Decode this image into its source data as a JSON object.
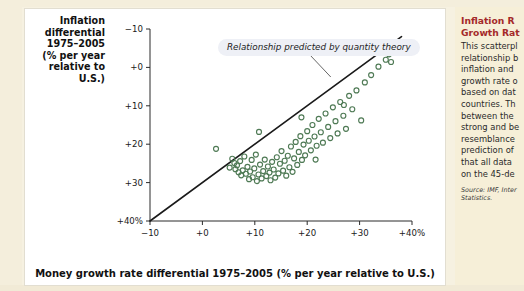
{
  "figure": {
    "panel_bg": "#ffffff",
    "page_bg": "#f6f1e1",
    "sidebar_bg": "#f6efd8",
    "marker_color": "#4f7a55",
    "line_color": "#1a1a1a",
    "title_color": "#a42a2a"
  },
  "axes": {
    "y_title": "Inflation\ndifferential\n1975–2005\n(% per year\nrelative to\nU.S.)",
    "x_title": "Money growth rate differential 1975–2005 (% per year relative to U.S.)",
    "y_ticks": [
      "+40%",
      "+30",
      "+20",
      "+10",
      "+0",
      "−10"
    ],
    "x_ticks": [
      "−10",
      "+0",
      "+10",
      "+20",
      "+30",
      "+40%"
    ]
  },
  "callout": {
    "text": "Relationship predicted by quantity theory"
  },
  "side_note": {
    "title": "Inflation R\nGrowth Rat",
    "body": "This scatterpl\nrelationship b\ninflation and\ngrowth rate o\nbased on dat\ncountries. Th\nbetween the\nstrong and be\nresemblance\nprediction of\nthat all data\non the 45-de",
    "source": "Source: IMF, Inter\nStatistics."
  },
  "chart_data": {
    "type": "scatter",
    "title": "",
    "xlabel": "Money growth rate differential 1975–2005 (% per year relative to U.S.)",
    "ylabel": "Inflation differential 1975–2005 (% per year relative to U.S.)",
    "xlim": [
      -10,
      40
    ],
    "ylim": [
      -10,
      40
    ],
    "xticks": [
      -10,
      0,
      10,
      20,
      30,
      40
    ],
    "yticks": [
      -10,
      0,
      10,
      20,
      30,
      40
    ],
    "grid": false,
    "legend": null,
    "annotations": [
      {
        "text": "Relationship predicted by quantity theory",
        "x": 14,
        "y": 37,
        "points_to": {
          "x": 24.5,
          "y": 27.5
        }
      }
    ],
    "reference_line": {
      "name": "45-degree line",
      "slope": 1,
      "intercept": 0,
      "from": {
        "x": -10,
        "y": -10
      },
      "to": {
        "x": 38,
        "y": 38
      },
      "color": "#1a1a1a"
    },
    "series": [
      {
        "name": "Countries",
        "marker": "open-circle",
        "color": "#4f7a55",
        "points": [
          {
            "x": 2.6,
            "y": 8.8
          },
          {
            "x": 5.2,
            "y": 3.9
          },
          {
            "x": 5.7,
            "y": 6.2
          },
          {
            "x": 6.1,
            "y": 5.1
          },
          {
            "x": 6.3,
            "y": 3.5
          },
          {
            "x": 6.6,
            "y": 4.5
          },
          {
            "x": 6.9,
            "y": 2.7
          },
          {
            "x": 7.2,
            "y": 5.6
          },
          {
            "x": 7.4,
            "y": 1.9
          },
          {
            "x": 7.7,
            "y": 3.2
          },
          {
            "x": 8.0,
            "y": 6.8
          },
          {
            "x": 8.3,
            "y": 2.3
          },
          {
            "x": 8.6,
            "y": 4.1
          },
          {
            "x": 8.9,
            "y": 0.9
          },
          {
            "x": 9.1,
            "y": 2.9
          },
          {
            "x": 9.4,
            "y": 5.9
          },
          {
            "x": 9.6,
            "y": 1.4
          },
          {
            "x": 9.9,
            "y": 3.7
          },
          {
            "x": 10.2,
            "y": 7.3
          },
          {
            "x": 10.4,
            "y": 0.4
          },
          {
            "x": 10.7,
            "y": 2.1
          },
          {
            "x": 11.0,
            "y": 4.7
          },
          {
            "x": 11.3,
            "y": 1.1
          },
          {
            "x": 11.6,
            "y": 3.0
          },
          {
            "x": 11.9,
            "y": 6.0
          },
          {
            "x": 12.2,
            "y": 1.7
          },
          {
            "x": 12.5,
            "y": 4.2
          },
          {
            "x": 12.8,
            "y": 2.6
          },
          {
            "x": 13.0,
            "y": 0.6
          },
          {
            "x": 13.3,
            "y": 5.4
          },
          {
            "x": 13.6,
            "y": 3.4
          },
          {
            "x": 13.9,
            "y": 1.3
          },
          {
            "x": 14.2,
            "y": 6.6
          },
          {
            "x": 14.5,
            "y": 2.4
          },
          {
            "x": 14.8,
            "y": 4.9
          },
          {
            "x": 15.1,
            "y": 8.2
          },
          {
            "x": 15.4,
            "y": 3.1
          },
          {
            "x": 15.7,
            "y": 5.7
          },
          {
            "x": 16.0,
            "y": 1.8
          },
          {
            "x": 16.3,
            "y": 7.0
          },
          {
            "x": 16.6,
            "y": 4.0
          },
          {
            "x": 16.9,
            "y": 9.4
          },
          {
            "x": 17.2,
            "y": 2.8
          },
          {
            "x": 17.5,
            "y": 6.3
          },
          {
            "x": 17.8,
            "y": 10.6
          },
          {
            "x": 18.1,
            "y": 4.6
          },
          {
            "x": 18.4,
            "y": 8.0
          },
          {
            "x": 18.7,
            "y": 12.1
          },
          {
            "x": 19.0,
            "y": 5.9
          },
          {
            "x": 19.3,
            "y": 9.9
          },
          {
            "x": 19.6,
            "y": 7.1
          },
          {
            "x": 20.0,
            "y": 13.4
          },
          {
            "x": 20.3,
            "y": 10.9
          },
          {
            "x": 20.7,
            "y": 8.4
          },
          {
            "x": 21.0,
            "y": 15.0
          },
          {
            "x": 21.4,
            "y": 12.0
          },
          {
            "x": 21.8,
            "y": 9.6
          },
          {
            "x": 22.2,
            "y": 16.6
          },
          {
            "x": 22.6,
            "y": 13.1
          },
          {
            "x": 23.0,
            "y": 10.4
          },
          {
            "x": 23.5,
            "y": 18.0
          },
          {
            "x": 24.0,
            "y": 14.5
          },
          {
            "x": 24.4,
            "y": 11.6
          },
          {
            "x": 24.9,
            "y": 19.6
          },
          {
            "x": 25.4,
            "y": 16.0
          },
          {
            "x": 25.8,
            "y": 12.8
          },
          {
            "x": 26.3,
            "y": 21.0
          },
          {
            "x": 26.9,
            "y": 17.4
          },
          {
            "x": 27.4,
            "y": 14.0
          },
          {
            "x": 28.0,
            "y": 22.6
          },
          {
            "x": 28.6,
            "y": 19.1
          },
          {
            "x": 29.4,
            "y": 24.0
          },
          {
            "x": 30.3,
            "y": 16.2
          },
          {
            "x": 31.0,
            "y": 26.1
          },
          {
            "x": 32.2,
            "y": 28.0
          },
          {
            "x": 33.6,
            "y": 30.2
          },
          {
            "x": 35.0,
            "y": 32.0
          },
          {
            "x": 35.6,
            "y": 33.4
          },
          {
            "x": 36.0,
            "y": 31.4
          },
          {
            "x": 21.6,
            "y": 6.0
          },
          {
            "x": 10.8,
            "y": 13.2
          },
          {
            "x": 18.9,
            "y": 17.0
          },
          {
            "x": 27.0,
            "y": 20.2
          }
        ]
      }
    ]
  }
}
